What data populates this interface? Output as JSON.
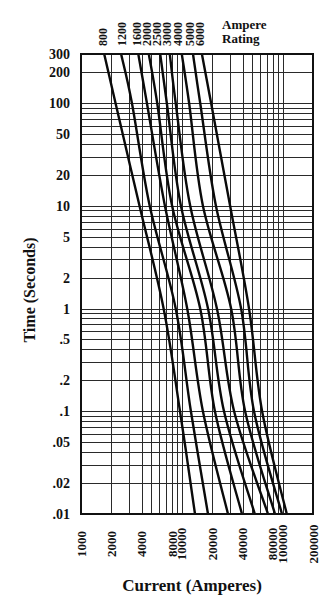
{
  "chart_data": {
    "type": "line",
    "title": "",
    "xlabel": "Current (Amperes)",
    "ylabel": "Time (Seconds)",
    "x_scale": "log",
    "y_scale": "log",
    "xlim": [
      1000,
      200000
    ],
    "ylim": [
      0.01,
      300
    ],
    "grid": true,
    "x_ticks": [
      1000,
      2000,
      4000,
      8000,
      10000,
      20000,
      40000,
      80000,
      100000,
      200000
    ],
    "x_tick_labels": [
      "1000",
      "2000",
      "4000",
      "8000",
      "10000",
      "20000",
      "40000",
      "80000",
      "100000",
      "200000"
    ],
    "y_ticks": [
      300,
      200,
      100,
      50,
      20,
      10,
      5,
      2,
      1,
      0.5,
      0.2,
      0.1,
      0.05,
      0.02,
      0.01
    ],
    "y_tick_labels": [
      "300",
      "200",
      "100",
      "50",
      "20",
      "10",
      "5",
      "2",
      "1",
      ".5",
      ".2",
      ".1",
      ".05",
      ".02",
      ".01"
    ],
    "x_grid": [
      1000,
      2000,
      3000,
      4000,
      5000,
      6000,
      7000,
      8000,
      9000,
      10000,
      20000,
      30000,
      40000,
      50000,
      60000,
      70000,
      80000,
      90000,
      100000,
      200000
    ],
    "y_grid": [
      0.01,
      0.02,
      0.03,
      0.04,
      0.05,
      0.06,
      0.07,
      0.08,
      0.09,
      0.1,
      0.2,
      0.3,
      0.4,
      0.5,
      0.6,
      0.7,
      0.8,
      0.9,
      1,
      2,
      3,
      4,
      5,
      6,
      7,
      8,
      9,
      10,
      20,
      30,
      40,
      50,
      60,
      70,
      80,
      90,
      100,
      200,
      300
    ],
    "legend_title": [
      "Ampere",
      "Rating"
    ],
    "legend_position": "top",
    "series": [
      {
        "name": "800",
        "points": [
          [
            1700,
            300
          ],
          [
            2200,
            100
          ],
          [
            3800,
            10
          ],
          [
            6600,
            1
          ],
          [
            9600,
            0.1
          ],
          [
            13500,
            0.01
          ]
        ]
      },
      {
        "name": "1200",
        "points": [
          [
            2500,
            300
          ],
          [
            3200,
            100
          ],
          [
            4800,
            10
          ],
          [
            8700,
            1
          ],
          [
            12300,
            0.1
          ],
          [
            18200,
            0.01
          ]
        ]
      },
      {
        "name": "1600",
        "points": [
          [
            3700,
            300
          ],
          [
            4500,
            100
          ],
          [
            6800,
            10
          ],
          [
            11300,
            1
          ],
          [
            16200,
            0.1
          ],
          [
            28700,
            0.01
          ]
        ]
      },
      {
        "name": "2000",
        "points": [
          [
            4700,
            300
          ],
          [
            5700,
            100
          ],
          [
            8000,
            10
          ],
          [
            15200,
            1
          ],
          [
            21300,
            0.1
          ],
          [
            39500,
            0.01
          ]
        ]
      },
      {
        "name": "2500",
        "points": [
          [
            6100,
            300
          ],
          [
            7100,
            100
          ],
          [
            9800,
            10
          ],
          [
            18200,
            1
          ],
          [
            26200,
            0.1
          ],
          [
            53000,
            0.01
          ]
        ]
      },
      {
        "name": "3000",
        "points": [
          [
            7600,
            300
          ],
          [
            8700,
            100
          ],
          [
            12100,
            10
          ],
          [
            22300,
            1
          ],
          [
            33000,
            0.1
          ],
          [
            71600,
            0.01
          ]
        ]
      },
      {
        "name": "4000",
        "points": [
          [
            10000,
            300
          ],
          [
            11800,
            100
          ],
          [
            16200,
            10
          ],
          [
            30800,
            1
          ],
          [
            42400,
            0.1
          ],
          [
            84000,
            0.01
          ]
        ]
      },
      {
        "name": "5000",
        "points": [
          [
            12900,
            300
          ],
          [
            15200,
            100
          ],
          [
            21800,
            10
          ],
          [
            38700,
            1
          ],
          [
            52000,
            0.1
          ],
          [
            98600,
            0.01
          ]
        ]
      },
      {
        "name": "6000",
        "points": [
          [
            15800,
            300
          ],
          [
            19500,
            100
          ],
          [
            30100,
            10
          ],
          [
            46400,
            1
          ],
          [
            62500,
            0.1
          ],
          [
            110000,
            0.01
          ]
        ]
      }
    ]
  }
}
